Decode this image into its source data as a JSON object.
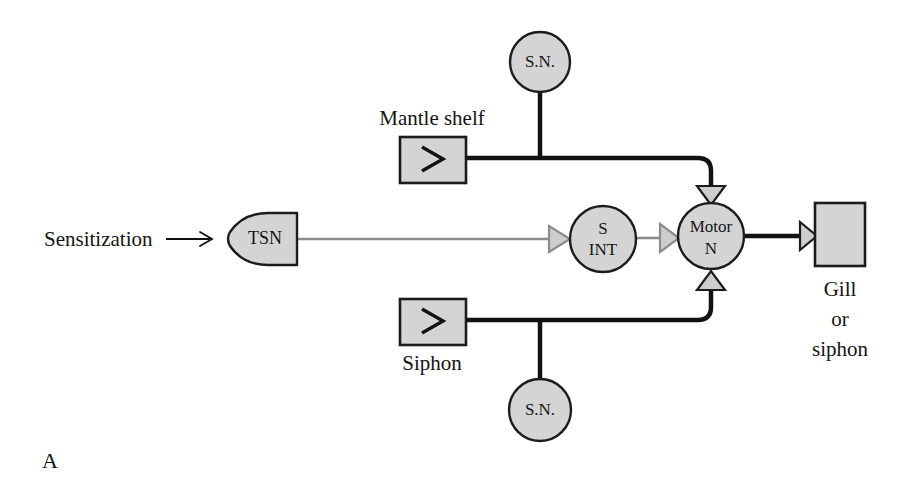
{
  "figure": {
    "panel_letter": "A",
    "width": 920,
    "height": 491,
    "background": "#ffffff"
  },
  "colors": {
    "node_fill": "#d4d4d4",
    "node_stroke": "#1c1c1c",
    "dark_line": "#121212",
    "gray_line": "#8c8c8c",
    "gray_marker_fill": "#c9c9c9",
    "gray_marker_stroke": "#8c8c8c",
    "text": "#141414"
  },
  "nodes": {
    "tsn": {
      "label": "TSN",
      "shape": "bullet-left",
      "cx": 262,
      "cy": 239
    },
    "s_int": {
      "label_line1": "S",
      "label_line2": "INT",
      "shape": "circle",
      "cx": 603,
      "cy": 239,
      "r": 33
    },
    "motor_n": {
      "label_line1": "Motor",
      "label_line2": "N",
      "shape": "circle",
      "cx": 711,
      "cy": 236,
      "r": 33
    },
    "sn_top": {
      "label": "S.N.",
      "shape": "circle",
      "cx": 540,
      "cy": 62,
      "r": 30
    },
    "sn_bottom": {
      "label": "S.N.",
      "shape": "circle",
      "cx": 540,
      "cy": 410,
      "r": 31
    },
    "mantle_shelf_receptor": {
      "shape": "rect-with-chevron",
      "x": 400,
      "y": 137,
      "w": 66,
      "h": 46
    },
    "siphon_receptor": {
      "shape": "rect-with-chevron",
      "x": 400,
      "y": 299,
      "w": 66,
      "h": 46
    },
    "effector": {
      "shape": "rect",
      "x": 815,
      "y": 203,
      "w": 50,
      "h": 63
    }
  },
  "labels": {
    "sensitization": "Sensitization",
    "sensitization_arrow": "→",
    "mantle_shelf": "Mantle shelf",
    "siphon": "Siphon",
    "effector_line1": "Gill",
    "effector_line2": "or",
    "effector_line3": "siphon"
  },
  "connections": [
    {
      "name": "sensitization-to-tsn",
      "from": "sensitization-text",
      "to": "tsn",
      "style": "thin-dark-arrow"
    },
    {
      "name": "tsn-to-s-int",
      "from": "tsn",
      "to": "s_int",
      "style": "gray-line-with-triangle",
      "synapse": "facilitatory"
    },
    {
      "name": "s-int-to-motor-n",
      "from": "s_int",
      "to": "motor_n",
      "style": "gray-line-with-triangle",
      "synapse": "facilitatory"
    },
    {
      "name": "mantle-sn-to-motor-n",
      "from": "sn_top",
      "to": "motor_n",
      "style": "thick-dark-line-with-triangle",
      "synapse": "excitatory"
    },
    {
      "name": "siphon-sn-to-motor-n",
      "from": "sn_bottom",
      "to": "motor_n",
      "style": "thick-dark-line-with-triangle",
      "synapse": "excitatory"
    },
    {
      "name": "motor-n-to-effector",
      "from": "motor_n",
      "to": "effector",
      "style": "thick-dark-line-with-triangle",
      "synapse": "neuromuscular"
    },
    {
      "name": "mantle-receptor-to-branch",
      "from": "mantle_shelf_receptor",
      "to": "sn_top",
      "style": "thick-dark-line"
    },
    {
      "name": "siphon-receptor-to-branch",
      "from": "siphon_receptor",
      "to": "sn_bottom",
      "style": "thick-dark-line"
    }
  ]
}
